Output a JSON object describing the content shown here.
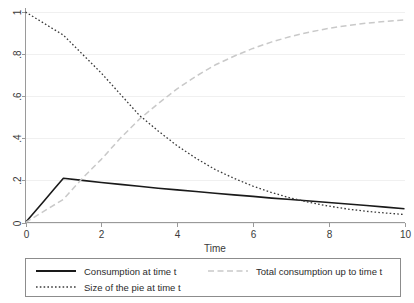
{
  "chart_data": {
    "type": "line",
    "title": "",
    "subtitle": "",
    "xlabel": "Time",
    "ylabel": "",
    "xlim": [
      0,
      10
    ],
    "ylim": [
      0,
      1
    ],
    "grid": true,
    "grid_axis": "y",
    "legend_position": "bottom",
    "x_ticks": [
      0,
      2,
      4,
      6,
      8,
      10
    ],
    "x_tick_labels": [
      "0",
      "2",
      "4",
      "6",
      "8",
      "10"
    ],
    "y_ticks": [
      0,
      0.2,
      0.4,
      0.6,
      0.8,
      1
    ],
    "y_tick_labels": [
      "0",
      ".2",
      ".4",
      ".6",
      ".8",
      "1"
    ],
    "series": [
      {
        "name": "Consumption at time t",
        "style": "solid",
        "color": "#1a1a1a",
        "width": 1.6,
        "x": [
          0,
          0.25,
          0.5,
          0.75,
          1,
          1.5,
          2,
          2.5,
          3,
          3.5,
          4,
          4.5,
          5,
          5.5,
          6,
          6.5,
          7,
          7.5,
          8,
          8.5,
          9,
          9.5,
          10
        ],
        "values": [
          0,
          0.0525,
          0.105,
          0.1575,
          0.21,
          0.2,
          0.19,
          0.181,
          0.172,
          0.163,
          0.155,
          0.147,
          0.139,
          0.131,
          0.124,
          0.116,
          0.109,
          0.102,
          0.095,
          0.088,
          0.081,
          0.073,
          0.065
        ]
      },
      {
        "name": "Total consumption up to time t",
        "style": "dashed",
        "color": "#c9c9c9",
        "width": 1.5,
        "x": [
          0,
          0.5,
          1,
          1.5,
          2,
          2.5,
          3,
          3.5,
          4,
          4.5,
          5,
          5.5,
          6,
          6.5,
          7,
          7.5,
          8,
          8.5,
          9,
          9.5,
          10
        ],
        "values": [
          0,
          0.055,
          0.11,
          0.21,
          0.3,
          0.4,
          0.49,
          0.565,
          0.635,
          0.695,
          0.748,
          0.79,
          0.827,
          0.858,
          0.884,
          0.905,
          0.922,
          0.936,
          0.947,
          0.955,
          0.962
        ]
      },
      {
        "name": "Size of the pie at time t",
        "style": "dotted",
        "color": "#3a3a3a",
        "width": 1.3,
        "x": [
          0,
          0.5,
          1,
          1.5,
          2,
          2.5,
          3,
          3.5,
          4,
          4.5,
          5,
          5.5,
          6,
          6.5,
          7,
          7.5,
          8,
          8.5,
          9,
          9.5,
          10
        ],
        "values": [
          1.0,
          0.945,
          0.89,
          0.8,
          0.71,
          0.61,
          0.51,
          0.435,
          0.365,
          0.305,
          0.252,
          0.21,
          0.173,
          0.142,
          0.116,
          0.095,
          0.078,
          0.064,
          0.053,
          0.045,
          0.038
        ]
      }
    ]
  },
  "legend": {
    "entries": [
      {
        "label": "Consumption at time t",
        "style": "solid",
        "color": "#1a1a1a"
      },
      {
        "label": "Total consumption up to time t",
        "style": "dashed",
        "color": "#c9c9c9"
      },
      {
        "label": "Size of the pie at time t",
        "style": "dotted",
        "color": "#3a3a3a"
      }
    ]
  },
  "colors": {
    "background": "#ffffff",
    "axis": "#9a9a9a",
    "grid": "#f0f0f0",
    "text": "#2b2b2b",
    "consumption": "#1a1a1a",
    "total_consumption": "#c9c9c9",
    "pie_size": "#3a3a3a"
  }
}
